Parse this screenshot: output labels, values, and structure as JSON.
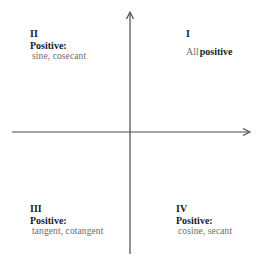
{
  "diagram": {
    "type": "quadrant-sign-chart",
    "axes": {
      "x_axis": {
        "arrow": "right"
      },
      "y_axis": {
        "arrow": "up"
      }
    },
    "quadrants": {
      "I": {
        "numeral": "I",
        "label_prefix": "All",
        "label_bold": "positive"
      },
      "II": {
        "numeral": "II",
        "heading": "Positive:",
        "functions": "sine, cosecant"
      },
      "III": {
        "numeral": "III",
        "heading": "Positive:",
        "functions": "tangent, cotangent"
      },
      "IV": {
        "numeral": "IV",
        "heading": "Positive:",
        "functions": "cosine, secant"
      }
    },
    "colors": {
      "axis": "#4a4a4a",
      "text": "#1a1a1a",
      "muted_text": "#6b6b6b",
      "background": "#ffffff"
    }
  }
}
